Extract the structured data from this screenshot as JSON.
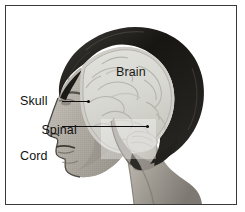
{
  "figure": {
    "style": "grayscale halftone photograph-style medical illustration",
    "frame_color": "#3a3a3a",
    "background_color": "#ffffff"
  },
  "labels": {
    "brain": "Brain",
    "skull": "Skull",
    "spinal_cord_line1": "Spinal",
    "spinal_cord_line2": "Cord"
  },
  "leaders": [
    {
      "name": "skull-leader",
      "from_label": "Skull"
    },
    {
      "name": "spinal-cord-leader",
      "from_label": "Spinal Cord"
    }
  ],
  "anatomy": {
    "hair_color": "#20201e",
    "brain_color": "#d9d9d4",
    "skin_color": "#b9b5ae",
    "outline_color": "#5a564f"
  }
}
